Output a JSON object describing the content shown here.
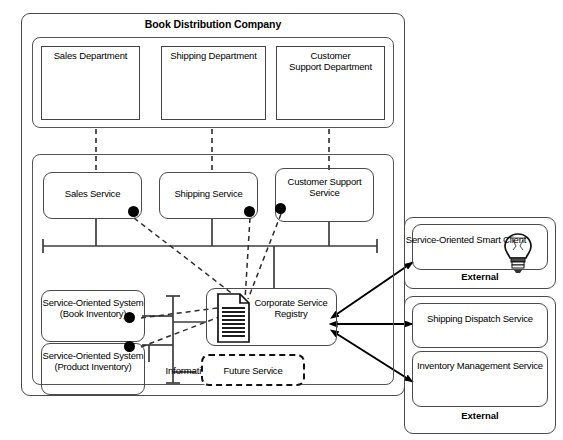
{
  "diagram": {
    "title": "Book Distribution Company",
    "company_group": {
      "label": "Book Distribution Company"
    },
    "departments_group": {
      "items": [
        {
          "label": "Sales Department",
          "icon": "cash-register-icon"
        },
        {
          "label": "Shipping Department",
          "icon": "delivery-truck-icon"
        },
        {
          "label": "Customer\nSupport Department",
          "icon": "support-agent-icon"
        }
      ]
    },
    "it_group": {
      "label": "Information Technology",
      "services": [
        {
          "label": "Sales Service",
          "has_interface_dot": true
        },
        {
          "label": "Shipping Service",
          "has_interface_dot": true
        },
        {
          "label": "Customer\nSupport\nService",
          "has_interface_dot": true
        }
      ],
      "systems": [
        {
          "label": "Service-Oriented\nSystem\n(Book Inventory)",
          "has_interface_dot": true
        },
        {
          "label": "Service-Oriented\nSystem\n(Product Inventory)",
          "has_interface_dot": true
        }
      ],
      "registry": {
        "label": "Corporate\nService\nRegistry",
        "icon": "document-registry-icon"
      },
      "future_service": {
        "label": "Future Service",
        "style": "dashed"
      }
    },
    "external_groups": [
      {
        "label": "External",
        "items": [
          {
            "label": "Service-Oriented\nSmart Client",
            "icon": "lightbulb-icon"
          }
        ]
      },
      {
        "label": "External",
        "items": [
          {
            "label": "Shipping Dispatch\nService",
            "icon": null
          },
          {
            "label": "Inventory\nManagement\nService",
            "icon": null
          }
        ]
      }
    ],
    "colors": {
      "line": "#4a4a4a",
      "stroke_dark": "#111111",
      "fill": "#ffffff",
      "dot": "#000000"
    }
  }
}
